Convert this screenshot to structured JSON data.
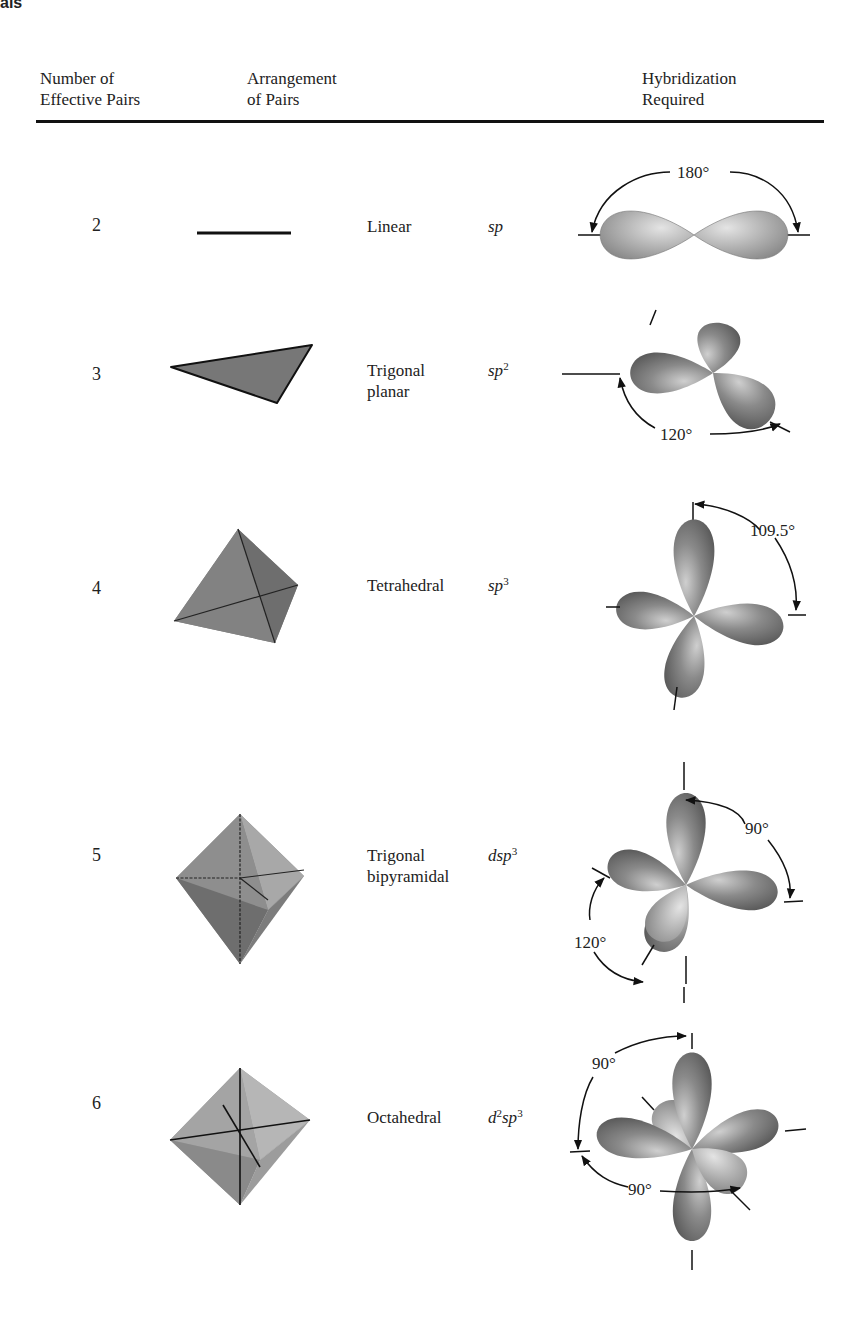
{
  "page": {
    "corner_label": "als"
  },
  "table": {
    "headers": {
      "number": [
        "Number of",
        "Effective Pairs"
      ],
      "arrangement": [
        "Arrangement",
        "of Pairs"
      ],
      "hybridization": [
        "Hybridization",
        "Required"
      ]
    },
    "rows": [
      {
        "number": "2",
        "shape_icon": "line-segment-icon",
        "arrangement": [
          "Linear"
        ],
        "hybrid_parts": {
          "d": "",
          "d_sup": "",
          "s": "sp",
          "p_sup": ""
        },
        "hybrid_text": "sp",
        "angles": [
          "180°"
        ]
      },
      {
        "number": "3",
        "shape_icon": "triangle-icon",
        "arrangement": [
          "Trigonal",
          "planar"
        ],
        "hybrid_parts": {
          "d": "",
          "d_sup": "",
          "s": "sp",
          "p_sup": "2"
        },
        "hybrid_text": "sp2",
        "angles": [
          "120°"
        ]
      },
      {
        "number": "4",
        "shape_icon": "tetrahedron-icon",
        "arrangement": [
          "Tetrahedral"
        ],
        "hybrid_parts": {
          "d": "",
          "d_sup": "",
          "s": "sp",
          "p_sup": "3"
        },
        "hybrid_text": "sp3",
        "angles": [
          "109.5°"
        ]
      },
      {
        "number": "5",
        "shape_icon": "trigonal-bipyramid-icon",
        "arrangement": [
          "Trigonal",
          "bipyramidal"
        ],
        "hybrid_parts": {
          "d": "d",
          "d_sup": "",
          "s": "sp",
          "p_sup": "3"
        },
        "hybrid_text": "dsp3",
        "angles": [
          "90°",
          "120°"
        ]
      },
      {
        "number": "6",
        "shape_icon": "octahedron-icon",
        "arrangement": [
          "Octahedral"
        ],
        "hybrid_parts": {
          "d": "d",
          "d_sup": "2",
          "s": "sp",
          "p_sup": "3"
        },
        "hybrid_text": "d2sp3",
        "angles": [
          "90°",
          "90°"
        ]
      }
    ]
  }
}
